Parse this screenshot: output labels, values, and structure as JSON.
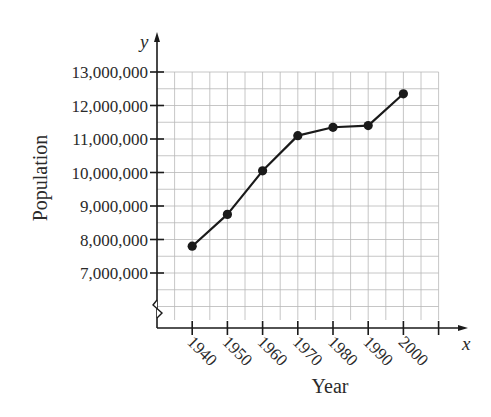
{
  "chart_data": {
    "type": "line",
    "title": "",
    "xlabel": "Year",
    "ylabel": "Population",
    "x_axis_var": "x",
    "y_axis_var": "y",
    "categories": [
      "1940",
      "1950",
      "1960",
      "1970",
      "1980",
      "1990",
      "2000"
    ],
    "x": [
      1940,
      1950,
      1960,
      1970,
      1980,
      1990,
      2000
    ],
    "values": [
      7800000,
      8750000,
      10050000,
      11100000,
      11350000,
      11400000,
      12350000
    ],
    "series": [
      {
        "name": "Population",
        "values": [
          7800000,
          8750000,
          10050000,
          11100000,
          11350000,
          11400000,
          12350000
        ],
        "marker": "filled-circle",
        "color": "#1a1a1a"
      }
    ],
    "y_ticks": [
      7000000,
      8000000,
      9000000,
      10000000,
      11000000,
      12000000,
      13000000
    ],
    "y_tick_labels": [
      "7,000,000",
      "8,000,000",
      "9,000,000",
      "10,000,000",
      "11,000,000",
      "12,000,000",
      "13,000,000"
    ],
    "x_tick_labels": [
      "1940",
      "1950",
      "1960",
      "1970",
      "1980",
      "1990",
      "2000"
    ],
    "ylim": [
      7000000,
      13000000
    ],
    "xlim": [
      1930,
      2010
    ],
    "grid": true,
    "y_axis_break": true,
    "legend": null
  },
  "colors": {
    "axis": "#1a1a1a",
    "grid": "#b8b8b8",
    "line": "#1a1a1a",
    "text": "#2a2a2a"
  }
}
